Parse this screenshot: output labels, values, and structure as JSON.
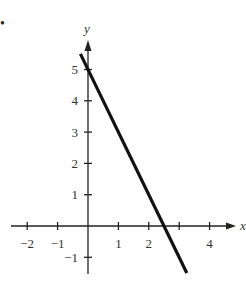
{
  "chart_data": {
    "type": "line",
    "title": "",
    "xlabel": "x",
    "ylabel": "y",
    "xlim": [
      -2.5,
      4.7
    ],
    "ylim": [
      -1.5,
      5.8
    ],
    "grid": false,
    "x_ticks": [
      -2,
      -1,
      1,
      2,
      3,
      4
    ],
    "x_tick_labels": [
      "−2",
      "−1",
      "1",
      "2",
      "",
      "4"
    ],
    "y_ticks": [
      -1,
      1,
      2,
      3,
      4,
      5
    ],
    "y_tick_labels": [
      "−1",
      "1",
      "2",
      "3",
      "4",
      "5"
    ],
    "series": [
      {
        "name": "y = -2x + 5",
        "x": [
          -0.25,
          3.25
        ],
        "y": [
          5.5,
          -1.5
        ],
        "slope": -2,
        "intercept": 5
      }
    ],
    "line_color": "#111111"
  },
  "marker": "•"
}
